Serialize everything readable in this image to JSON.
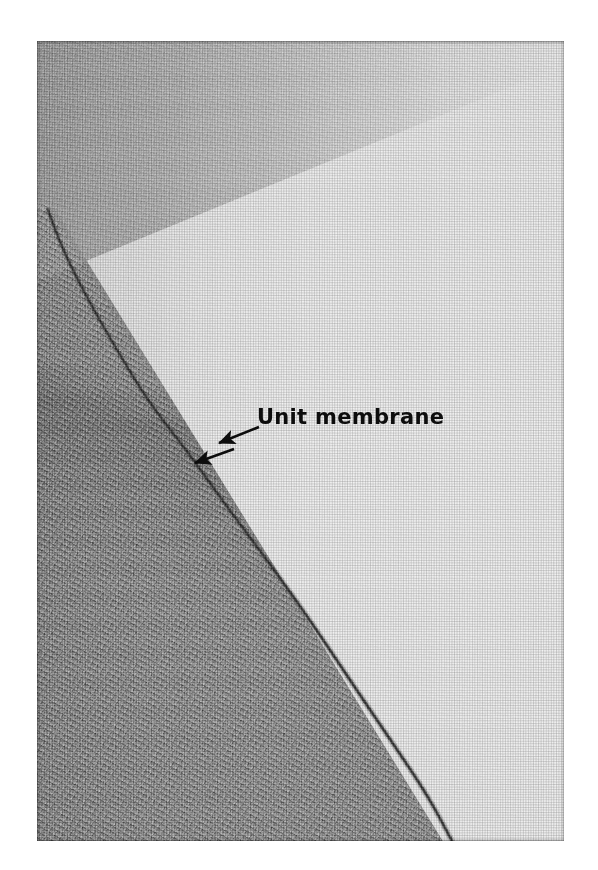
{
  "figure": {
    "kind": "electron-micrograph",
    "annotation": {
      "label": "Unit membrane",
      "arrows": [
        {
          "name": "arrow-upper",
          "from_x": 259,
          "from_y": 427,
          "to_x": 219,
          "to_y": 443
        },
        {
          "name": "arrow-lower",
          "from_x": 234,
          "from_y": 449,
          "to_x": 195,
          "to_y": 463
        }
      ]
    },
    "plate": {
      "left": 37,
      "top": 41,
      "width": 527,
      "height": 800
    },
    "regions": [
      {
        "name": "cytoplasm-dark-region",
        "tone": "#8a8a8a"
      },
      {
        "name": "extracellular-light-region",
        "tone": "#e9e9e9"
      },
      {
        "name": "upper-grey-band",
        "tone": "#a3a3a3"
      }
    ],
    "membrane": {
      "name": "unit-membrane-boundary",
      "tone": "#3a3a3a",
      "path_points": [
        [
          48,
          210
        ],
        [
          62,
          248
        ],
        [
          86,
          296
        ],
        [
          118,
          352
        ],
        [
          150,
          404
        ],
        [
          188,
          452
        ],
        [
          222,
          500
        ],
        [
          258,
          548
        ],
        [
          296,
          600
        ],
        [
          330,
          650
        ],
        [
          362,
          698
        ],
        [
          396,
          748
        ],
        [
          428,
          796
        ],
        [
          452,
          841
        ]
      ]
    },
    "page_background": "#ffffff"
  }
}
